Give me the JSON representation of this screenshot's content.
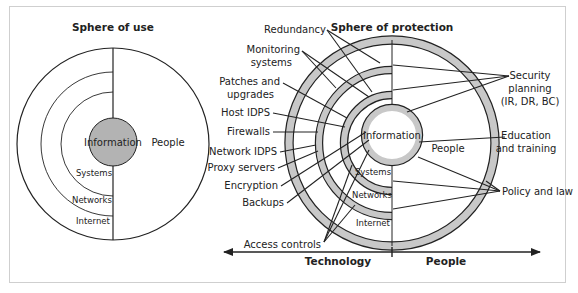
{
  "colors": {
    "ring_fill": "#c8c8c8",
    "info_fill": "#b3b3b3",
    "stroke": "#222222",
    "frame": "#cfcfcf",
    "background": "#ffffff"
  },
  "sphere_of_use": {
    "title": "Sphere of use",
    "center_label": "Information",
    "right_label": "People",
    "layers": [
      "Systems",
      "Networks",
      "Internet"
    ]
  },
  "sphere_of_protection": {
    "title": "Sphere of protection",
    "center_label": "Information",
    "right_label": "People",
    "layers": [
      "Systems",
      "Networks",
      "Internet"
    ],
    "left_controls": [
      {
        "label": "Redundancy"
      },
      {
        "label": "Monitoring",
        "label2": "systems"
      },
      {
        "label": "Patches and",
        "label2": "upgrades"
      },
      {
        "label": "Host IDPS"
      },
      {
        "label": "Firewalls"
      },
      {
        "label": "Network IDPS"
      },
      {
        "label": "Proxy servers"
      },
      {
        "label": "Encryption"
      },
      {
        "label": "Backups"
      },
      {
        "label": "Access controls"
      }
    ],
    "right_controls": [
      {
        "label": "Security",
        "label2": "planning",
        "label3": "(IR, DR, BC)"
      },
      {
        "label": "Education",
        "label2": "and training"
      },
      {
        "label": "Policy and law"
      }
    ]
  },
  "axis": {
    "left_label": "Technology",
    "right_label": "People"
  }
}
